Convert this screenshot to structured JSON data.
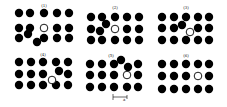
{
  "diagram": {
    "atom_radius": 4.2,
    "vacancy_radius": 3.8,
    "colors": {
      "atom": "#000000",
      "vacancy_fill": "#ffffff",
      "background": "#ffffff"
    },
    "panels": [
      {
        "label": "(1)",
        "label_pos": [
          44,
          7
        ],
        "atoms": [
          [
            19,
            13
          ],
          [
            30,
            13
          ],
          [
            44,
            13
          ],
          [
            57,
            13
          ],
          [
            69,
            13
          ],
          [
            19,
            28
          ],
          [
            30,
            28
          ],
          [
            57,
            28
          ],
          [
            69,
            28
          ],
          [
            19,
            38
          ],
          [
            28,
            34
          ],
          [
            37,
            42
          ],
          [
            44,
            38
          ],
          [
            57,
            38
          ],
          [
            69,
            38
          ]
        ],
        "vacancy": [
          44,
          28
        ]
      },
      {
        "label": "(2)",
        "label_pos": [
          115,
          9
        ],
        "atoms": [
          [
            91,
            17
          ],
          [
            102,
            17
          ],
          [
            115,
            17
          ],
          [
            127,
            17
          ],
          [
            139,
            17
          ],
          [
            91,
            29
          ],
          [
            100,
            31
          ],
          [
            106,
            24
          ],
          [
            127,
            29
          ],
          [
            139,
            29
          ],
          [
            91,
            40
          ],
          [
            102,
            40
          ],
          [
            115,
            40
          ],
          [
            127,
            40
          ],
          [
            139,
            40
          ]
        ],
        "vacancy": [
          115,
          29
        ]
      },
      {
        "label": "(3)",
        "label_pos": [
          186,
          9
        ],
        "atoms": [
          [
            162,
            17
          ],
          [
            174,
            17
          ],
          [
            186,
            17
          ],
          [
            198,
            17
          ],
          [
            209,
            17
          ],
          [
            162,
            28
          ],
          [
            174,
            28
          ],
          [
            182,
            25
          ],
          [
            198,
            28
          ],
          [
            209,
            28
          ],
          [
            162,
            40
          ],
          [
            174,
            40
          ],
          [
            186,
            40
          ],
          [
            198,
            40
          ],
          [
            209,
            40
          ]
        ],
        "vacancy": [
          190,
          32
        ]
      },
      {
        "label": "(4)",
        "label_pos": [
          43,
          56
        ],
        "atoms": [
          [
            19,
            62
          ],
          [
            31,
            62
          ],
          [
            43,
            62
          ],
          [
            56,
            62
          ],
          [
            68,
            62
          ],
          [
            19,
            74
          ],
          [
            31,
            74
          ],
          [
            43,
            74
          ],
          [
            59,
            71
          ],
          [
            68,
            74
          ],
          [
            19,
            85
          ],
          [
            31,
            85
          ],
          [
            43,
            85
          ],
          [
            56,
            85
          ],
          [
            68,
            85
          ]
        ],
        "vacancy": [
          52,
          80
        ]
      },
      {
        "label": "(5)",
        "label_pos": [
          111,
          57
        ],
        "atoms": [
          [
            90,
            64
          ],
          [
            102,
            64
          ],
          [
            114,
            64
          ],
          [
            121,
            60
          ],
          [
            138,
            64
          ],
          [
            128,
            67
          ],
          [
            90,
            75
          ],
          [
            102,
            75
          ],
          [
            114,
            75
          ],
          [
            138,
            75
          ],
          [
            90,
            87
          ],
          [
            102,
            87
          ],
          [
            114,
            87
          ],
          [
            127,
            87
          ],
          [
            138,
            87
          ]
        ],
        "vacancy": [
          127,
          75
        ]
      },
      {
        "label": "(6)",
        "label_pos": [
          186,
          57
        ],
        "atoms": [
          [
            162,
            64
          ],
          [
            174,
            64
          ],
          [
            186,
            64
          ],
          [
            198,
            64
          ],
          [
            209,
            64
          ],
          [
            162,
            76
          ],
          [
            174,
            76
          ],
          [
            186,
            76
          ],
          [
            209,
            76
          ],
          [
            162,
            89
          ],
          [
            174,
            89
          ],
          [
            186,
            89
          ],
          [
            198,
            89
          ],
          [
            209,
            89
          ]
        ],
        "vacancy": [
          198,
          76
        ]
      }
    ],
    "scale_bar": {
      "label": "a",
      "x1": 113,
      "x2": 127,
      "y": 97,
      "label_pos": [
        123,
        101
      ]
    }
  }
}
